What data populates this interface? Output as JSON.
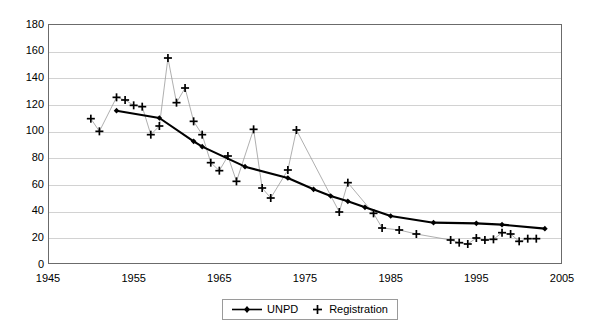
{
  "chart_data": {
    "type": "line",
    "title": "",
    "xlabel": "",
    "ylabel": "",
    "xlim": [
      1945,
      2005
    ],
    "ylim": [
      0,
      180
    ],
    "ytick_values": [
      0,
      20,
      40,
      60,
      80,
      100,
      120,
      140,
      160,
      180
    ],
    "ytick_labels": [
      "0",
      "20",
      "40",
      "60",
      "80",
      "100",
      "120",
      "140",
      "160",
      "180"
    ],
    "xtick_values": [
      1945,
      1955,
      1965,
      1975,
      1985,
      1995,
      2005
    ],
    "xtick_labels": [
      "1945",
      "1955",
      "1965",
      "1975",
      "1985",
      "1995",
      "2005"
    ],
    "grid": "horizontal",
    "legend_position": "bottom-center",
    "series": [
      {
        "name": "UNPD",
        "marker": "diamond",
        "line_style": "solid-thick",
        "color": "#000000",
        "points": [
          [
            1953,
            115.0
          ],
          [
            1958,
            109.5
          ],
          [
            1962,
            92.0
          ],
          [
            1963,
            88.0
          ],
          [
            1968,
            73.0
          ],
          [
            1973,
            64.5
          ],
          [
            1976,
            56.0
          ],
          [
            1978,
            51.0
          ],
          [
            1980,
            47.0
          ],
          [
            1982,
            42.5
          ],
          [
            1985,
            36.0
          ],
          [
            1990,
            31.0
          ],
          [
            1995,
            30.5
          ],
          [
            1998,
            29.5
          ],
          [
            2003,
            26.5
          ]
        ]
      },
      {
        "name": "Registration",
        "marker": "plus",
        "line_style": "thin-connector",
        "color": "#000000",
        "points": [
          [
            1950,
            109.0
          ],
          [
            1951,
            99.5
          ],
          [
            1953,
            125.0
          ],
          [
            1954,
            123.0
          ],
          [
            1955,
            119.0
          ],
          [
            1956,
            118.0
          ],
          [
            1957,
            97.0
          ],
          [
            1958,
            103.5
          ],
          [
            1959,
            154.5
          ],
          [
            1960,
            121.0
          ],
          [
            1961,
            132.0
          ],
          [
            1962,
            107.0
          ],
          [
            1963,
            97.0
          ],
          [
            1964,
            76.0
          ],
          [
            1965,
            70.0
          ],
          [
            1966,
            81.0
          ],
          [
            1967,
            62.0
          ],
          [
            1969,
            101.0
          ],
          [
            1970,
            57.0
          ],
          [
            1971,
            49.5
          ],
          [
            1973,
            70.5
          ],
          [
            1974,
            100.5
          ],
          [
            1979,
            39.0
          ],
          [
            1980,
            61.0
          ],
          [
            1983,
            38.0
          ],
          [
            1984,
            27.0
          ],
          [
            1986,
            25.5
          ],
          [
            1988,
            22.5
          ],
          [
            1992,
            18.0
          ],
          [
            1993,
            16.0
          ],
          [
            1994,
            15.0
          ],
          [
            1995,
            19.5
          ],
          [
            1996,
            18.0
          ],
          [
            1997,
            18.5
          ],
          [
            1998,
            23.5
          ],
          [
            1999,
            22.5
          ],
          [
            2000,
            17.0
          ],
          [
            2001,
            19.0
          ],
          [
            2002,
            19.0
          ]
        ]
      }
    ]
  },
  "legend": {
    "entries": [
      {
        "label": "UNPD",
        "marker": "line-diamond-marker"
      },
      {
        "label": "Registration",
        "marker": "plus-marker"
      }
    ]
  }
}
